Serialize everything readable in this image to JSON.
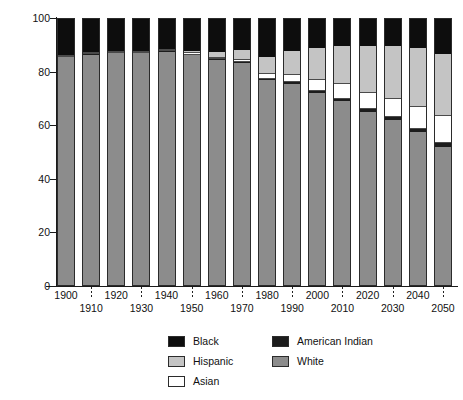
{
  "chart_data": {
    "type": "bar",
    "subtype": "stacked-percentage",
    "title": "",
    "xlabel": "",
    "ylabel": "Percent",
    "ylim": [
      0,
      100
    ],
    "yticks": [
      0,
      20,
      40,
      60,
      80,
      100
    ],
    "grid": false,
    "legend_position": "bottom",
    "stack_order_top_to_bottom": [
      "Black",
      "Hispanic",
      "Asian",
      "American Indian",
      "White"
    ],
    "categories": [
      "1900",
      "1910",
      "1920",
      "1930",
      "1940",
      "1950",
      "1960",
      "1970",
      "1980",
      "1990",
      "2000",
      "2010",
      "2020",
      "2030",
      "2040",
      "2050"
    ],
    "series": [
      {
        "name": "White",
        "color": "#8c8c8c",
        "values": [
          86.0,
          87.0,
          87.5,
          87.5,
          88.0,
          86.3,
          84.5,
          83.5,
          77.0,
          75.5,
          72.0,
          69.0,
          65.0,
          62.0,
          57.5,
          52.0
        ]
      },
      {
        "name": "American Indian",
        "color": "#1c1c1c",
        "values": [
          0.2,
          0.2,
          0.2,
          0.2,
          0.3,
          0.3,
          0.4,
          0.4,
          0.6,
          0.8,
          0.9,
          1.0,
          1.1,
          1.2,
          1.3,
          1.5
        ]
      },
      {
        "name": "Asian",
        "color": "#ffffff",
        "values": [
          0.3,
          0.3,
          0.3,
          0.3,
          0.3,
          0.5,
          0.6,
          0.8,
          1.6,
          2.8,
          4.1,
          5.5,
          6.2,
          6.8,
          8.0,
          10.0
        ]
      },
      {
        "name": "Hispanic",
        "color": "#c4c4c4",
        "values": [
          0.0,
          0.0,
          0.0,
          0.0,
          0.0,
          1.0,
          2.0,
          3.5,
          6.5,
          9.0,
          12.0,
          14.5,
          17.7,
          20.0,
          22.2,
          23.5
        ]
      },
      {
        "name": "Black",
        "color": "#0d0d0d",
        "values": [
          13.5,
          12.5,
          12.0,
          12.0,
          11.4,
          11.9,
          12.5,
          11.8,
          14.3,
          11.9,
          11.0,
          10.0,
          10.0,
          10.0,
          11.0,
          13.0
        ]
      }
    ]
  },
  "axis": {
    "y_title": "Percent",
    "y_tick_labels": [
      "100",
      "80",
      "60",
      "40",
      "20",
      "0"
    ],
    "x_tick_labels_row1": [
      "1900",
      "1920",
      "1940",
      "1960",
      "1980",
      "2000",
      "2020",
      "2040"
    ],
    "x_tick_labels_row2": [
      "1910",
      "1930",
      "1950",
      "1970",
      "1990",
      "2010",
      "2030",
      "2050"
    ]
  },
  "legend": {
    "column_one": [
      {
        "label": "Black",
        "swatch": "black-swatch"
      },
      {
        "label": "Hispanic",
        "swatch": "hispanic-swatch"
      },
      {
        "label": "Asian",
        "swatch": "asian-swatch"
      }
    ],
    "column_two": [
      {
        "label": "American Indian",
        "swatch": "american-indian-swatch"
      },
      {
        "label": "White",
        "swatch": "white-swatch"
      }
    ]
  }
}
